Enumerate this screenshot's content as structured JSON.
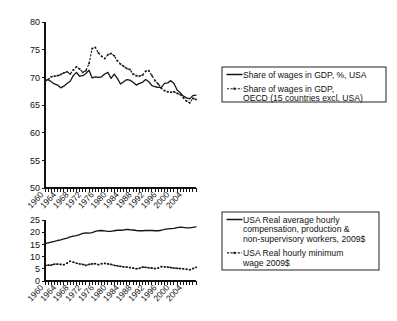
{
  "chart_data": [
    {
      "id": "share-of-wages",
      "type": "line",
      "title": "",
      "xlabel": "",
      "ylabel": "",
      "xlim": [
        1960,
        2008
      ],
      "ylim": [
        50,
        80
      ],
      "ytick_labels": [
        "50",
        "55",
        "60",
        "65",
        "70",
        "75",
        "80"
      ],
      "yticks": [
        50,
        55,
        60,
        65,
        70,
        75,
        80
      ],
      "xtick_labels": [
        "1960",
        "1964",
        "1968",
        "1972",
        "1976",
        "1980",
        "1984",
        "1988",
        "1992",
        "1996",
        "2000",
        "2004"
      ],
      "xticks": [
        1960,
        1964,
        1968,
        1972,
        1976,
        1980,
        1984,
        1988,
        1992,
        1996,
        2000,
        2004
      ],
      "minor_xtick_step": 1,
      "grid": false,
      "legend_position": "right",
      "x": [
        1960,
        1961,
        1962,
        1963,
        1964,
        1965,
        1966,
        1967,
        1968,
        1969,
        1970,
        1971,
        1972,
        1973,
        1974,
        1975,
        1976,
        1977,
        1978,
        1979,
        1980,
        1981,
        1982,
        1983,
        1984,
        1985,
        1986,
        1987,
        1988,
        1989,
        1990,
        1991,
        1992,
        1993,
        1994,
        1995,
        1996,
        1997,
        1998,
        1999,
        2000,
        2001,
        2002,
        2003,
        2004,
        2005,
        2006,
        2007,
        2008
      ],
      "series": [
        {
          "name": "Share of wages in GDP, %, USA",
          "style": "solid",
          "values": [
            69.4,
            69.6,
            69.2,
            68.8,
            68.6,
            68.1,
            68.4,
            68.9,
            69.3,
            70.3,
            70.9,
            70.2,
            70.3,
            70.7,
            71.3,
            69.9,
            70.1,
            70.0,
            70.1,
            70.6,
            70.9,
            69.8,
            70.6,
            69.8,
            68.8,
            69.2,
            69.6,
            69.5,
            69.1,
            68.6,
            68.9,
            69.1,
            69.6,
            69.2,
            68.5,
            68.3,
            68.2,
            68.2,
            68.9,
            69.0,
            69.4,
            68.9,
            67.7,
            67.2,
            66.6,
            66.3,
            66.1,
            66.7,
            66.8
          ]
        },
        {
          "name": "Share of wages in GDP, OECD (15 countries excl. USA)",
          "style": "dotted-marker",
          "values": [
            69.3,
            69.6,
            70.1,
            70.2,
            70.3,
            70.5,
            70.8,
            71.0,
            70.6,
            71.3,
            71.9,
            71.5,
            70.9,
            71.2,
            72.5,
            75.2,
            75.4,
            74.4,
            73.8,
            73.4,
            74.1,
            74.3,
            73.9,
            73.0,
            72.4,
            72.0,
            71.6,
            71.4,
            70.6,
            70.3,
            70.2,
            70.4,
            71.1,
            71.2,
            70.3,
            69.4,
            68.8,
            68.0,
            67.6,
            67.4,
            67.3,
            67.4,
            67.1,
            66.9,
            66.3,
            65.7,
            65.4,
            66.2,
            66.0
          ]
        }
      ],
      "legend": [
        {
          "label_lines": [
            "Share of wages in GDP, %, USA"
          ],
          "style": "solid"
        },
        {
          "label_lines": [
            "Share of wages in GDP,",
            "OECD (15 countries excl. USA)"
          ],
          "style": "dotted-marker"
        }
      ]
    },
    {
      "id": "real-wages",
      "type": "line",
      "title": "",
      "xlabel": "",
      "ylabel": "",
      "xlim": [
        1960,
        2008
      ],
      "ylim": [
        0,
        25
      ],
      "ytick_labels": [
        "0",
        "5",
        "10",
        "15",
        "20",
        "25"
      ],
      "yticks": [
        0,
        5,
        10,
        15,
        20,
        25
      ],
      "xtick_labels": [
        "1960",
        "1964",
        "1968",
        "1972",
        "1976",
        "1980",
        "1984",
        "1988",
        "1992",
        "1996",
        "2000",
        "2004"
      ],
      "xticks": [
        1960,
        1964,
        1968,
        1972,
        1976,
        1980,
        1984,
        1988,
        1992,
        1996,
        2000,
        2004
      ],
      "minor_xtick_step": 1,
      "grid": false,
      "legend_position": "right",
      "x": [
        1960,
        1961,
        1962,
        1963,
        1964,
        1965,
        1966,
        1967,
        1968,
        1969,
        1970,
        1971,
        1972,
        1973,
        1974,
        1975,
        1976,
        1977,
        1978,
        1979,
        1980,
        1981,
        1982,
        1983,
        1984,
        1985,
        1986,
        1987,
        1988,
        1989,
        1990,
        1991,
        1992,
        1993,
        1994,
        1995,
        1996,
        1997,
        1998,
        1999,
        2000,
        2001,
        2002,
        2003,
        2004,
        2005,
        2006,
        2007,
        2008
      ],
      "series": [
        {
          "name": "USA Real average hourly compensation, production & non-supervisory workers, 2009$",
          "style": "solid",
          "values": [
            15.3,
            15.6,
            15.9,
            16.2,
            16.6,
            16.9,
            17.3,
            17.6,
            18.1,
            18.4,
            18.6,
            19.0,
            19.5,
            19.7,
            19.6,
            19.8,
            20.3,
            20.6,
            20.7,
            20.5,
            20.3,
            20.3,
            20.6,
            20.8,
            20.8,
            20.9,
            21.2,
            21.0,
            20.9,
            20.7,
            20.6,
            20.6,
            20.7,
            20.7,
            20.7,
            20.6,
            20.6,
            20.8,
            21.2,
            21.4,
            21.5,
            21.6,
            21.9,
            22.1,
            22.0,
            21.8,
            21.8,
            22.0,
            22.2
          ]
        },
        {
          "name": "USA Real hourly minimum wage 2009$",
          "style": "dotted-marker",
          "values": [
            6.3,
            6.5,
            6.5,
            6.9,
            6.9,
            6.8,
            6.7,
            7.3,
            8.1,
            7.7,
            7.3,
            7.0,
            6.8,
            6.4,
            6.8,
            7.0,
            7.1,
            6.7,
            7.1,
            7.2,
            7.0,
            6.8,
            6.4,
            6.2,
            6.0,
            5.8,
            5.7,
            5.5,
            5.3,
            5.0,
            5.2,
            5.7,
            5.6,
            5.4,
            5.3,
            5.1,
            5.3,
            5.9,
            5.8,
            5.7,
            5.5,
            5.3,
            5.2,
            5.1,
            5.0,
            4.8,
            4.6,
            5.1,
            5.6
          ]
        }
      ],
      "legend": [
        {
          "label_lines": [
            "USA Real average hourly",
            "compensation, production &",
            "non-supervisory workers, 2009$"
          ],
          "style": "solid"
        },
        {
          "label_lines": [
            "USA Real hourly minimum",
            "wage 2009$"
          ],
          "style": "dotted-marker"
        }
      ]
    }
  ],
  "colors": {
    "ink": "#151515",
    "background": "#ffffff"
  }
}
